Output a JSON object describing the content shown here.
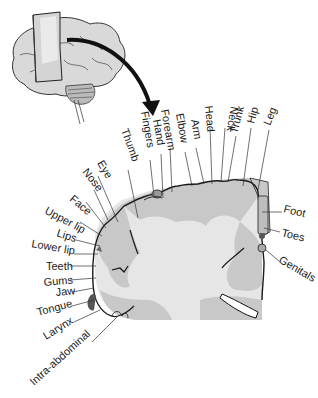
{
  "figure": {
    "type": "motor homunculus on coronal brain section",
    "colors": {
      "background": "#ffffff",
      "cortex_gray": "#c8c8c8",
      "white_matter": "#e6e6e6",
      "outline": "#1a1a1a",
      "leader_lines": "#333333",
      "brain_fill": "#d9d9d9",
      "plane_fill": "#d8d8d8"
    }
  },
  "labels": {
    "top": [
      "Thumb",
      "Fingers",
      "Hand",
      "Forearm",
      "Elbow",
      "Arm",
      "Head",
      "Neck",
      "Trunk",
      "Hip",
      "Leg"
    ],
    "right": [
      "Foot",
      "Toes",
      "Genitals"
    ],
    "left": [
      "Eye",
      "Nose",
      "Face",
      "Upper lip",
      "Lips",
      "Lower lip",
      "Teeth",
      "Gums",
      "Jaw",
      "Tongue",
      "Larynx",
      "Intra-abdominal"
    ]
  }
}
